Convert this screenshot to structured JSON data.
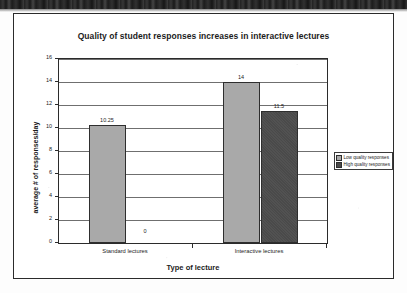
{
  "chart_data": {
    "type": "bar",
    "title": "Quality of student responses increases in interactive lectures",
    "xlabel": "Type of lecture",
    "ylabel": "average # of responses/day",
    "categories": [
      "Standard lectures",
      "Interactive lectures"
    ],
    "series": [
      {
        "name": "Low quality responses",
        "color": "#a9a9a9",
        "values": [
          10.25,
          14
        ],
        "value_labels": [
          "10.25",
          "14"
        ]
      },
      {
        "name": "High quality responses",
        "color": "#4a4a4a",
        "values": [
          0,
          11.5
        ],
        "value_labels": [
          "0",
          "11.5"
        ]
      }
    ],
    "ylim": [
      0,
      16
    ],
    "yticks": [
      0,
      2,
      4,
      6,
      8,
      10,
      12,
      14,
      16
    ],
    "ytick_labels": [
      "0",
      "2",
      "4",
      "6",
      "8",
      "10",
      "12",
      "14",
      "16"
    ],
    "grid": true,
    "legend_position": "right"
  },
  "legend": {
    "entries": [
      {
        "label": "Low quality responses"
      },
      {
        "label": "High quality responses"
      }
    ]
  }
}
